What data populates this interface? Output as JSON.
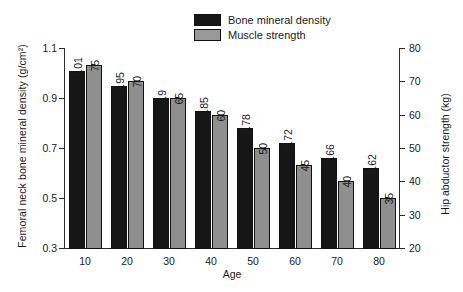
{
  "chart_data": {
    "type": "bar",
    "title": "",
    "xlabel": "Age",
    "ylabel": "Femoral neck bone mineral density (g/cm²)",
    "ylabel_right": "Hip abductor strength (kg)",
    "categories": [
      "10",
      "20",
      "30",
      "40",
      "50",
      "60",
      "70",
      "80"
    ],
    "series": [
      {
        "name": "Bone mineral density",
        "color": "#161616",
        "axis": "left",
        "values": [
          1.01,
          0.95,
          0.9,
          0.85,
          0.78,
          0.72,
          0.66,
          0.62
        ],
        "labels": [
          "1.01",
          "0.95",
          "0.9",
          "0.85",
          "0.78",
          "0.72",
          "0.66",
          "0.62"
        ]
      },
      {
        "name": "Muscle strength",
        "color": "#8f8f8f",
        "axis": "right",
        "values": [
          75,
          70,
          65,
          60,
          50,
          45,
          40,
          35
        ],
        "labels": [
          "75",
          "70",
          "65",
          "60",
          "50",
          "45",
          "40",
          "35"
        ]
      }
    ],
    "ylim": [
      0.3,
      1.1
    ],
    "yticks": [
      "1.1",
      "0.9",
      "0.7",
      "0.5",
      "0.3"
    ],
    "ylim_right": [
      20,
      80
    ],
    "yticks_right": [
      "80",
      "70",
      "60",
      "50",
      "40",
      "30",
      "20"
    ],
    "grid": false,
    "legend_position": "top-right"
  },
  "legend": {
    "items": [
      {
        "label": "Bone mineral density"
      },
      {
        "label": "Muscle strength"
      }
    ]
  }
}
